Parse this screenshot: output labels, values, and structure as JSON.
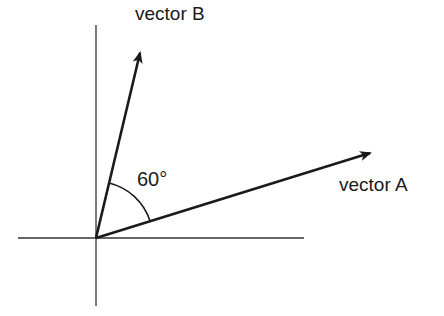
{
  "diagram": {
    "type": "vector-angle",
    "vectors": [
      {
        "name": "vector A",
        "label": "vector A"
      },
      {
        "name": "vector B",
        "label": "vector B"
      }
    ],
    "angle": {
      "label": "60°",
      "value": 60,
      "unit": "degrees"
    },
    "colors": {
      "line": "#1a1a1a",
      "axis": "#333333",
      "background": "#ffffff"
    }
  }
}
